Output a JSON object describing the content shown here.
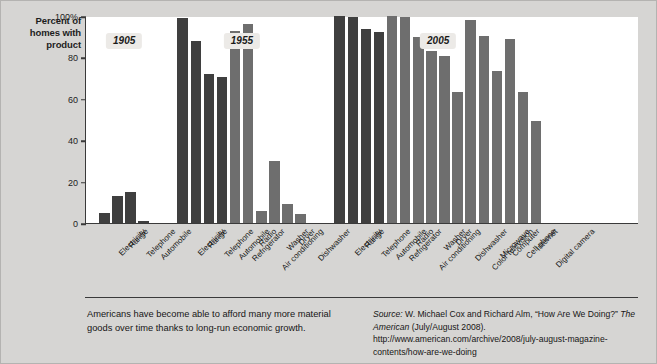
{
  "figure": {
    "y_axis_title": "Percent of homes with product",
    "caption_left": "Americans have become able to afford many more material goods over time thanks to long-run economic growth.",
    "source_prefix": "Source:",
    "source_mid": " W. Michael Cox and Richard Alm, “How Are We Doing?” ",
    "source_italic2": "The American",
    "source_tail": " (July/August 2008). http://www.american.com/archive/2008/july-august-magazine-contents/how-are-we-doing"
  },
  "colors": {
    "bar_dark": "#3f3f3f",
    "bar_light": "#6e6e6e",
    "plot_bg": "#ffffff",
    "page_bg": "#d6d5d3",
    "axis": "#3a3a3a",
    "badge_bg": "#eceae7"
  },
  "chart_data": {
    "type": "bar",
    "title": "",
    "xlabel": "",
    "ylabel": "Percent of homes with product",
    "ylim": [
      0,
      100
    ],
    "ytick_labels": [
      "0",
      "20",
      "40",
      "60",
      "80",
      "100%"
    ],
    "ytick_values": [
      0,
      20,
      40,
      60,
      80,
      100
    ],
    "grid": false,
    "legend": "none",
    "groups": [
      {
        "year": "1905",
        "categories": [
          "Electricity",
          "Range",
          "Telephone",
          "Automobile"
        ],
        "values": [
          5,
          13,
          15,
          1
        ],
        "shades": [
          "dark",
          "dark",
          "dark",
          "dark"
        ]
      },
      {
        "year": "1955",
        "categories": [
          "Electricity",
          "Range",
          "Telephone",
          "Automobile",
          "Refrigerator",
          "Radio",
          "Air conditioning",
          "Washer",
          "Dryer",
          "Dishwasher"
        ],
        "values": [
          99,
          88,
          72,
          70.5,
          93,
          96,
          6,
          30,
          9,
          4.5
        ],
        "shades": [
          "dark",
          "dark",
          "dark",
          "dark",
          "light",
          "light",
          "light",
          "light",
          "light",
          "light"
        ]
      },
      {
        "year": "2005",
        "categories": [
          "Electricity",
          "Range",
          "Telephone",
          "Automobile",
          "Refrigerator",
          "Radio",
          "Air conditioning",
          "Washer",
          "Dryer",
          "Dishwasher",
          "Color television",
          "Microwave",
          "Computer",
          "Cell phone",
          "Internet",
          "Digital camera"
        ],
        "values": [
          100,
          99.5,
          93.5,
          92.5,
          100,
          99.5,
          90,
          83,
          80.5,
          63.5,
          98,
          90.5,
          73.5,
          89,
          63.5,
          49.5
        ],
        "shades": [
          "dark",
          "dark",
          "dark",
          "dark",
          "light",
          "light",
          "light",
          "light",
          "light",
          "light",
          "light",
          "light",
          "light",
          "light",
          "light",
          "light"
        ]
      }
    ]
  }
}
